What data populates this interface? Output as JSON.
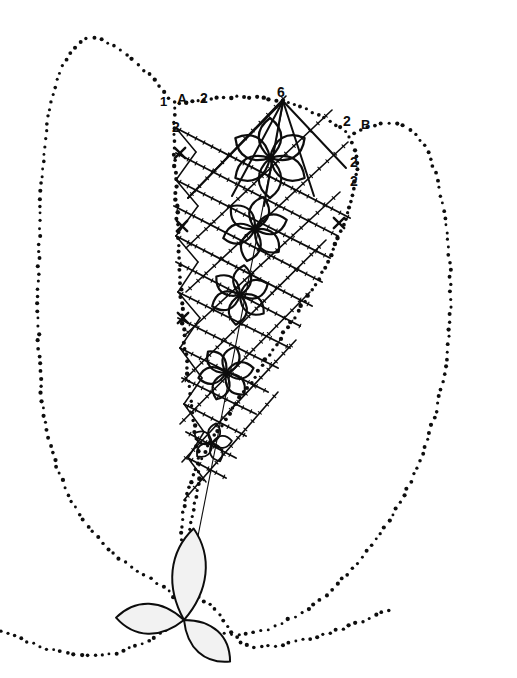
{
  "canvas": {
    "width": 517,
    "height": 678,
    "background": "#ffffff",
    "ink": "#0d0d0d",
    "title": "Embroidery pattern diagram - dotted outline with rosette motifs"
  },
  "labels": [
    {
      "id": "label-1",
      "text": "1",
      "x": 160,
      "y": 95,
      "size": 13
    },
    {
      "id": "label-A",
      "text": "A",
      "x": 177,
      "y": 92,
      "size": 14
    },
    {
      "id": "label-2-top",
      "text": "2",
      "x": 200,
      "y": 91,
      "size": 14
    },
    {
      "id": "label-6",
      "text": "6",
      "x": 277,
      "y": 85,
      "size": 14
    },
    {
      "id": "label-2-left",
      "text": "2",
      "x": 172,
      "y": 120,
      "size": 14
    },
    {
      "id": "label-2-right1",
      "text": "2",
      "x": 343,
      "y": 114,
      "size": 14
    },
    {
      "id": "label-B",
      "text": "B",
      "x": 361,
      "y": 118,
      "size": 13
    },
    {
      "id": "label-2-right2",
      "text": "2",
      "x": 350,
      "y": 155,
      "size": 14
    },
    {
      "id": "label-2-right3",
      "text": "2",
      "x": 350,
      "y": 174,
      "size": 14
    }
  ],
  "cross_markers": [
    {
      "id": "cross-left-1",
      "x": 180,
      "y": 153
    },
    {
      "id": "cross-left-2",
      "x": 182,
      "y": 226
    },
    {
      "id": "cross-left-3",
      "x": 183,
      "y": 318
    },
    {
      "id": "cross-right-1",
      "x": 339,
      "y": 223
    }
  ],
  "rosettes": [
    {
      "id": "rosette-1",
      "x": 270,
      "y": 158,
      "petals": 6,
      "radius": 40,
      "width": 15,
      "rotation": 0,
      "stroke": 2.2
    },
    {
      "id": "rosette-2",
      "x": 255,
      "y": 229,
      "petals": 6,
      "radius": 33,
      "width": 13,
      "rotation": 14,
      "stroke": 2.2
    },
    {
      "id": "rosette-3",
      "x": 240,
      "y": 295,
      "petals": 6,
      "radius": 30,
      "width": 12,
      "rotation": 8,
      "stroke": 2.2
    },
    {
      "id": "rosette-4",
      "x": 226,
      "y": 373,
      "petals": 6,
      "radius": 28,
      "width": 11,
      "rotation": 20,
      "stroke": 2.2
    },
    {
      "id": "rosette-5",
      "x": 212,
      "y": 443,
      "petals": 5,
      "radius": 20,
      "width": 8,
      "rotation": 12,
      "stroke": 1.8
    }
  ],
  "trefoil": {
    "id": "trefoil-bottom",
    "x": 184,
    "y": 620,
    "petals": [
      {
        "angle": -84,
        "length": 92,
        "width": 22
      },
      {
        "angle": 182,
        "length": 68,
        "width": 20
      },
      {
        "angle": 42,
        "length": 62,
        "width": 19
      }
    ],
    "stroke": 2.0,
    "fill": "#f2f2f2"
  },
  "outer_contour": {
    "id": "outer-dotted-contour",
    "dot_radius": 1.7,
    "spacing": 7.5,
    "points": [
      [
        168,
        98
      ],
      [
        150,
        76
      ],
      [
        131,
        58
      ],
      [
        113,
        45
      ],
      [
        96,
        38
      ],
      [
        84,
        39
      ],
      [
        72,
        49
      ],
      [
        62,
        66
      ],
      [
        55,
        86
      ],
      [
        49,
        112
      ],
      [
        45,
        142
      ],
      [
        42,
        176
      ],
      [
        40,
        212
      ],
      [
        39,
        250
      ],
      [
        38,
        288
      ],
      [
        38,
        324
      ],
      [
        39,
        358
      ],
      [
        41,
        390
      ],
      [
        45,
        420
      ],
      [
        51,
        448
      ],
      [
        59,
        474
      ],
      [
        69,
        497
      ],
      [
        81,
        517
      ],
      [
        94,
        534
      ],
      [
        108,
        549
      ],
      [
        124,
        562
      ],
      [
        140,
        573
      ],
      [
        156,
        582
      ],
      [
        170,
        592
      ],
      [
        180,
        604
      ],
      [
        184,
        618
      ],
      [
        200,
        628
      ],
      [
        220,
        634
      ],
      [
        244,
        635
      ],
      [
        272,
        628
      ],
      [
        300,
        614
      ],
      [
        326,
        595
      ],
      [
        350,
        572
      ],
      [
        372,
        546
      ],
      [
        392,
        516
      ],
      [
        410,
        483
      ],
      [
        425,
        448
      ],
      [
        436,
        412
      ],
      [
        444,
        376
      ],
      [
        449,
        340
      ],
      [
        451,
        304
      ],
      [
        450,
        268
      ],
      [
        447,
        232
      ],
      [
        442,
        200
      ],
      [
        435,
        172
      ],
      [
        427,
        150
      ],
      [
        417,
        135
      ],
      [
        406,
        126
      ],
      [
        394,
        122
      ],
      [
        380,
        123
      ],
      [
        364,
        128
      ],
      [
        347,
        136
      ]
    ]
  },
  "wedge_contour": {
    "id": "wedge-dotted-outline",
    "dot_radius": 1.8,
    "spacing": 6.5,
    "points": [
      [
        179,
        104
      ],
      [
        196,
        100
      ],
      [
        214,
        98
      ],
      [
        232,
        97
      ],
      [
        250,
        97
      ],
      [
        266,
        98
      ],
      [
        282,
        101
      ],
      [
        298,
        106
      ],
      [
        314,
        113
      ],
      [
        330,
        121
      ],
      [
        344,
        130
      ],
      [
        352,
        142
      ],
      [
        356,
        156
      ],
      [
        357,
        172
      ],
      [
        354,
        190
      ],
      [
        349,
        210
      ],
      [
        341,
        232
      ],
      [
        331,
        254
      ],
      [
        320,
        276
      ],
      [
        308,
        296
      ],
      [
        296,
        315
      ],
      [
        284,
        333
      ],
      [
        272,
        351
      ],
      [
        260,
        369
      ],
      [
        248,
        387
      ],
      [
        236,
        404
      ],
      [
        225,
        420
      ],
      [
        215,
        435
      ],
      [
        206,
        450
      ],
      [
        198,
        465
      ],
      [
        191,
        480
      ],
      [
        186,
        496
      ],
      [
        183,
        512
      ],
      [
        182,
        530
      ],
      [
        181,
        550
      ],
      [
        181,
        570
      ],
      [
        182,
        592
      ],
      [
        183,
        610
      ],
      [
        184,
        618
      ]
    ]
  },
  "wedge_left_edge": {
    "id": "wedge-left-dotted-edge",
    "dot_radius": 1.8,
    "spacing": 6.5,
    "points": [
      [
        175,
        102
      ],
      [
        174,
        120
      ],
      [
        174,
        142
      ],
      [
        175,
        166
      ],
      [
        176,
        192
      ],
      [
        177,
        218
      ],
      [
        179,
        244
      ],
      [
        180,
        270
      ],
      [
        181,
        296
      ],
      [
        183,
        322
      ],
      [
        185,
        348
      ],
      [
        188,
        374
      ],
      [
        191,
        400
      ],
      [
        194,
        424
      ],
      [
        197,
        446
      ],
      [
        199,
        466
      ],
      [
        198,
        486
      ],
      [
        194,
        506
      ],
      [
        190,
        528
      ],
      [
        186,
        552
      ],
      [
        184,
        578
      ],
      [
        184,
        600
      ],
      [
        184,
        618
      ]
    ]
  },
  "trefoil_guides": {
    "id": "trefoil-dotted-guides",
    "dot_radius": 1.7,
    "spacing": 7.0,
    "segments": [
      [
        [
          184,
          618
        ],
        [
          150,
          640
        ],
        [
          120,
          652
        ],
        [
          96,
          656
        ],
        [
          70,
          654
        ],
        [
          44,
          648
        ],
        [
          18,
          638
        ],
        [
          0,
          630
        ]
      ],
      [
        [
          184,
          618
        ],
        [
          196,
          596
        ],
        [
          210,
          604
        ],
        [
          222,
          618
        ],
        [
          232,
          632
        ],
        [
          240,
          642
        ],
        [
          252,
          647
        ],
        [
          274,
          646
        ],
        [
          300,
          641
        ],
        [
          330,
          633
        ],
        [
          360,
          622
        ],
        [
          392,
          608
        ]
      ]
    ]
  },
  "grid": {
    "id": "lattice-grid",
    "description": "diagonal lattice of stitched lines with tick marks",
    "stroke": 1.9,
    "tick_stroke": 1.1,
    "tick_len": 4,
    "tick_spacing": 9,
    "lines_a": [
      [
        [
          176,
          128
        ],
        [
          350,
          218
        ]
      ],
      [
        [
          176,
          153
        ],
        [
          338,
          236
        ]
      ],
      [
        [
          176,
          180
        ],
        [
          330,
          258
        ]
      ],
      [
        [
          174,
          206
        ],
        [
          322,
          282
        ]
      ],
      [
        [
          176,
          236
        ],
        [
          312,
          306
        ]
      ],
      [
        [
          176,
          262
        ],
        [
          300,
          326
        ]
      ],
      [
        [
          178,
          292
        ],
        [
          290,
          348
        ]
      ],
      [
        [
          178,
          318
        ],
        [
          278,
          368
        ]
      ],
      [
        [
          180,
          348
        ],
        [
          268,
          392
        ]
      ],
      [
        [
          182,
          378
        ],
        [
          256,
          414
        ]
      ],
      [
        [
          184,
          404
        ],
        [
          246,
          436
        ]
      ],
      [
        [
          186,
          432
        ],
        [
          236,
          458
        ]
      ],
      [
        [
          188,
          458
        ],
        [
          226,
          478
        ]
      ]
    ],
    "lines_b": [
      [
        [
          188,
          198
        ],
        [
          286,
          96
        ]
      ],
      [
        [
          186,
          248
        ],
        [
          332,
          110
        ]
      ],
      [
        [
          186,
          292
        ],
        [
          348,
          142
        ]
      ],
      [
        [
          184,
          336
        ],
        [
          340,
          192
        ]
      ],
      [
        [
          182,
          382
        ],
        [
          326,
          240
        ]
      ],
      [
        [
          180,
          424
        ],
        [
          310,
          292
        ]
      ],
      [
        [
          182,
          462
        ],
        [
          296,
          340
        ]
      ],
      [
        [
          184,
          500
        ],
        [
          278,
          392
        ]
      ]
    ],
    "zigzag_left": [
      [
        176,
        128
      ],
      [
        196,
        152
      ],
      [
        176,
        180
      ],
      [
        198,
        206
      ],
      [
        176,
        236
      ],
      [
        198,
        262
      ],
      [
        178,
        292
      ],
      [
        200,
        318
      ],
      [
        180,
        348
      ],
      [
        202,
        378
      ],
      [
        184,
        404
      ],
      [
        204,
        432
      ],
      [
        188,
        458
      ],
      [
        206,
        482
      ]
    ],
    "long_diagonal": [
      [
        284,
        100
      ],
      [
        183,
        612
      ]
    ]
  },
  "top_fan": {
    "id": "top-fan-lines",
    "apex": [
      283,
      101
    ],
    "stroke": 2.0,
    "rays": [
      [
        283,
        101,
        188,
        198
      ],
      [
        283,
        101,
        232,
        196
      ],
      [
        283,
        101,
        314,
        196
      ],
      [
        283,
        101,
        346,
        168
      ],
      [
        283,
        101,
        264,
        206
      ]
    ]
  }
}
